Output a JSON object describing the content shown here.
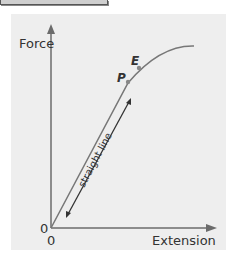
{
  "diagram": {
    "y_axis_label": "Force",
    "x_axis_label": "Extension",
    "origin_y_label": "0",
    "origin_x_label": "0",
    "point_p_label": "P",
    "point_e_label": "E",
    "annotation": "straight line",
    "colors": {
      "panel": "#eeeeee",
      "axes": "#6b6b6b",
      "curve": "#777777",
      "text": "#333333"
    }
  }
}
